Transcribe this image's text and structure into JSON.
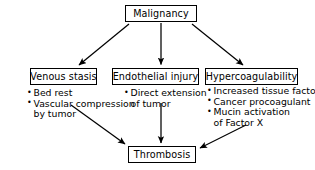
{
  "diagram": {
    "type": "flowchart",
    "background_color": "#ffffff",
    "line_color": "#000000",
    "text_color": "#000000",
    "nodes": {
      "root": {
        "label": "Malignancy"
      },
      "left": {
        "label": "Venous stasis"
      },
      "middle": {
        "label": "Endothelial injury"
      },
      "right": {
        "label": "Hypercoagulability"
      },
      "outcome": {
        "label": "Thrombosis"
      }
    },
    "lists": {
      "venous_stasis": [
        {
          "text": "Bed rest",
          "bullet": true
        },
        {
          "text": "Vascular compression",
          "bullet": true
        },
        {
          "text": "by tumor",
          "bullet": false
        }
      ],
      "endothelial_injury": [
        {
          "text": "Direct extension",
          "bullet": true
        },
        {
          "text": "of tumor",
          "bullet": false
        }
      ],
      "hypercoagulability": [
        {
          "text": "Increased tissue factor",
          "bullet": true
        },
        {
          "text": "Cancer procoagulant",
          "bullet": true
        },
        {
          "text": "Mucin activation",
          "bullet": true
        },
        {
          "text": "of Factor X",
          "bullet": false
        }
      ]
    },
    "arrows": [
      {
        "name": "malignancy-to-venous-stasis",
        "from": "Malignancy",
        "to": "Venous stasis"
      },
      {
        "name": "malignancy-to-endothelial-injury",
        "from": "Malignancy",
        "to": "Endothelial injury"
      },
      {
        "name": "malignancy-to-hypercoagulability",
        "from": "Malignancy",
        "to": "Hypercoagulability"
      },
      {
        "name": "venous-stasis-to-thrombosis",
        "from": "Venous stasis",
        "to": "Thrombosis"
      },
      {
        "name": "endothelial-injury-to-thrombosis",
        "from": "Endothelial injury",
        "to": "Thrombosis"
      },
      {
        "name": "hypercoagulability-to-thrombosis",
        "from": "Hypercoagulability",
        "to": "Thrombosis"
      }
    ]
  }
}
